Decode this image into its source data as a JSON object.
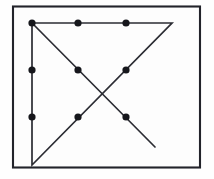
{
  "figure": {
    "background_color": "#fefefe",
    "canvas": {
      "width": 214,
      "height": 179
    }
  },
  "frame": {
    "name": "outer-border",
    "x": 13,
    "y": 6.5,
    "width": 187,
    "height": 161,
    "stroke_color": "#22232a",
    "stroke_width": 2.1,
    "fill_color": "#fdfdfd"
  },
  "grid": {
    "rows": 3,
    "columns": 3,
    "dot_radius": 3.6,
    "dot_color": "#16171c",
    "column_x": [
      32,
      78,
      126
    ],
    "row_y": [
      23,
      70,
      117
    ],
    "dots": [
      {
        "id": "dot-r1c1",
        "row": 1,
        "col": 1,
        "cx": 32,
        "cy": 23
      },
      {
        "id": "dot-r1c2",
        "row": 1,
        "col": 2,
        "cx": 78,
        "cy": 23
      },
      {
        "id": "dot-r1c3",
        "row": 1,
        "col": 3,
        "cx": 126,
        "cy": 23
      },
      {
        "id": "dot-r2c1",
        "row": 2,
        "col": 1,
        "cx": 32,
        "cy": 70
      },
      {
        "id": "dot-r2c2",
        "row": 2,
        "col": 2,
        "cx": 78,
        "cy": 70
      },
      {
        "id": "dot-r2c3",
        "row": 2,
        "col": 3,
        "cx": 126,
        "cy": 70
      },
      {
        "id": "dot-r3c1",
        "row": 3,
        "col": 1,
        "cx": 32,
        "cy": 117
      },
      {
        "id": "dot-r3c2",
        "row": 3,
        "col": 2,
        "cx": 78,
        "cy": 117
      },
      {
        "id": "dot-r3c3",
        "row": 3,
        "col": 3,
        "cx": 126,
        "cy": 117
      }
    ]
  },
  "solution_path": {
    "stroke_color": "#2b2c33",
    "stroke_width": 1.7,
    "polyline_points": "32,23 172,23 32,165 32,23",
    "extra_segment_points": "32,23 155,147",
    "segments": [
      {
        "id": "segment-top-horizontal",
        "from": [
          32,
          23
        ],
        "to": [
          172,
          23
        ],
        "direction": "left-to-right",
        "extends_beyond_grid": true
      },
      {
        "id": "segment-diagonal-down-left",
        "from": [
          172,
          23
        ],
        "to": [
          32,
          165
        ],
        "direction": "upper-right-to-lower-left",
        "extends_beyond_grid": true
      },
      {
        "id": "segment-left-vertical",
        "from": [
          32,
          165
        ],
        "to": [
          32,
          23
        ],
        "direction": "bottom-to-top",
        "extends_beyond_grid": true
      },
      {
        "id": "segment-diagonal-down-right",
        "from": [
          32,
          23
        ],
        "to": [
          155,
          147
        ],
        "direction": "upper-left-to-lower-right",
        "extends_beyond_grid": true
      }
    ],
    "crossing_point": [
      102,
      94
    ]
  }
}
